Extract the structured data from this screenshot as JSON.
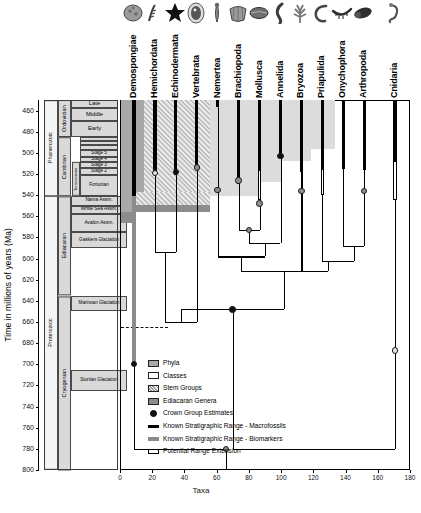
{
  "figure": {
    "y_axis_label": "Time in millions of years (Ma)",
    "x_axis_label": "Taxa",
    "y_ticks": [
      460,
      480,
      500,
      520,
      540,
      560,
      580,
      600,
      620,
      640,
      660,
      680,
      700,
      720,
      740,
      760,
      780,
      800
    ],
    "y_min": 450,
    "y_max": 800,
    "x_ticks": [
      0,
      20,
      40,
      60,
      80,
      100,
      120,
      140,
      160,
      180
    ],
    "x_min": 0,
    "x_max": 180
  },
  "colors": {
    "macrofossil": "#000000",
    "biomarker": "#8b8b8b",
    "extension": "#ffffff",
    "phyla_shade": "#a8a8a8",
    "classes_shade": "#ffffff",
    "stem_shade": "#9a9a9a",
    "ediacaran_shade": "#8c8c8c"
  },
  "timescale": {
    "eons": [
      {
        "label": "Phanerozoic",
        "top": 450,
        "bottom": 541
      },
      {
        "label": "Proterozoic",
        "top": 541,
        "bottom": 800
      }
    ],
    "periods": [
      {
        "label": "Ordovician",
        "top": 450,
        "bottom": 485
      },
      {
        "label": "Cambrian",
        "top": 485,
        "bottom": 541
      },
      {
        "label": "Ediacaran",
        "top": 541,
        "bottom": 635
      },
      {
        "label": "Cryogenian",
        "top": 635,
        "bottom": 800
      }
    ],
    "epochs": [
      {
        "label": "Late",
        "top": 450,
        "bottom": 458
      },
      {
        "label": "Middle",
        "top": 458,
        "bottom": 470
      },
      {
        "label": "Early",
        "top": 470,
        "bottom": 485
      }
    ],
    "cambrian_series": [
      {
        "label": "",
        "top": 485,
        "bottom": 489
      },
      {
        "label": "",
        "top": 489,
        "bottom": 493
      },
      {
        "label": "",
        "top": 493,
        "bottom": 497
      },
      {
        "label": "Stage 5",
        "top": 497,
        "bottom": 504
      },
      {
        "label": "Stage 4",
        "top": 504,
        "bottom": 509
      },
      {
        "label": "Stage 3",
        "top": 509,
        "bottom": 514
      },
      {
        "label": "Stage 2",
        "top": 514,
        "bottom": 521
      },
      {
        "label": "Fortunian",
        "top": 521,
        "bottom": 541
      }
    ],
    "cambrian_series_sidelabel": "Terreneuvian",
    "assemblages": [
      {
        "label": "Nama Assm.",
        "top": 541,
        "bottom": 550
      },
      {
        "label": "White Sea Assm.",
        "top": 550,
        "bottom": 558
      },
      {
        "label": "Avalon Assm.",
        "top": 558,
        "bottom": 575
      }
    ],
    "glaciations": [
      {
        "label": "Gaskiers Glaciation",
        "top": 575,
        "bottom": 590
      },
      {
        "label": "Marinoan Glaciation",
        "top": 635,
        "bottom": 650
      },
      {
        "label": "Sturtian Glaciation",
        "top": 705,
        "bottom": 725
      }
    ]
  },
  "legend": {
    "items": [
      {
        "key": "phyla-swatch",
        "label": "Phyla"
      },
      {
        "key": "classes-swatch",
        "label": "Classes"
      },
      {
        "key": "stem-groups-swatch",
        "label": "Stem Groups"
      },
      {
        "key": "ediacaran-genera-swatch",
        "label": "Ediacaran Genera"
      },
      {
        "key": "crown-group-node",
        "label": "Crown Group Estimates"
      },
      {
        "key": "macrofossil-bar",
        "label": "Known Stratigraphic Range - Macrofossils"
      },
      {
        "key": "biomarker-bar",
        "label": "Known Stratigraphic Range - Biomarkers"
      },
      {
        "key": "extension-bar",
        "label": "Potential Range Extension"
      }
    ]
  },
  "chart_data": {
    "type": "diagram",
    "title": "",
    "xlabel": "Taxa",
    "ylabel": "Time in millions of years (Ma)",
    "xlim": [
      0,
      180
    ],
    "ylim": [
      800,
      450
    ],
    "grid": false,
    "taxa": [
      {
        "name": "Demospongiae",
        "icon": "sponge-icon",
        "x": 8,
        "macro_top": 450,
        "macro_bottom": 541,
        "biomarker_top": 541,
        "biomarker_bottom": 700,
        "extension_top": null,
        "extension_bottom": null,
        "crown_ma": 700,
        "crown_style": "dark"
      },
      {
        "name": "Hemichordata",
        "icon": "graptolite-icon",
        "x": 21,
        "macro_top": 450,
        "macro_bottom": 521,
        "biomarker_top": null,
        "biomarker_bottom": null,
        "extension_top": null,
        "extension_bottom": null,
        "crown_ma": 519,
        "crown_style": "light"
      },
      {
        "name": "Echinodermata",
        "icon": "starfish-icon",
        "x": 34,
        "macro_top": 450,
        "macro_bottom": 521,
        "biomarker_top": null,
        "biomarker_bottom": null,
        "extension_top": null,
        "extension_bottom": null,
        "crown_ma": 518,
        "crown_style": "dark"
      },
      {
        "name": "Vertebrata",
        "icon": "fish-fossil-icon",
        "x": 47,
        "macro_top": 450,
        "macro_bottom": 516,
        "biomarker_top": null,
        "biomarker_bottom": null,
        "extension_top": null,
        "extension_bottom": null,
        "crown_ma": 514,
        "crown_style": "grey"
      },
      {
        "name": "Nemertea",
        "icon": "worm-icon",
        "x": 60,
        "macro_top": 450,
        "macro_bottom": 457,
        "biomarker_top": null,
        "biomarker_bottom": null,
        "extension_top": null,
        "extension_bottom": null,
        "crown_ma": 535,
        "crown_style": "grey"
      },
      {
        "name": "Brachiopoda",
        "icon": "brachiopod-icon",
        "x": 73,
        "macro_top": 450,
        "macro_bottom": 529,
        "biomarker_top": null,
        "biomarker_bottom": null,
        "extension_top": null,
        "extension_bottom": null,
        "crown_ma": 526,
        "crown_style": "grey"
      },
      {
        "name": "Mollusca",
        "icon": "mollusc-icon",
        "x": 86,
        "macro_top": 450,
        "macro_bottom": 516,
        "biomarker_top": null,
        "biomarker_bottom": null,
        "extension_top": 516,
        "extension_bottom": 545,
        "crown_ma": 548,
        "crown_style": "grey"
      },
      {
        "name": "Annelida",
        "icon": "annelid-icon",
        "x": 99,
        "macro_top": 450,
        "macro_bottom": 505,
        "biomarker_top": null,
        "biomarker_bottom": null,
        "extension_top": null,
        "extension_bottom": null,
        "crown_ma": 503,
        "crown_style": "dark"
      },
      {
        "name": "Bryozoa",
        "icon": "bryozoan-icon",
        "x": 112,
        "macro_top": 450,
        "macro_bottom": 518,
        "biomarker_top": null,
        "biomarker_bottom": null,
        "extension_top": null,
        "extension_bottom": null,
        "crown_ma": 536,
        "crown_style": "grey"
      },
      {
        "name": "Priapulida",
        "icon": "priapulid-icon",
        "x": 125,
        "macro_top": 450,
        "macro_bottom": 515,
        "biomarker_top": null,
        "biomarker_bottom": null,
        "extension_top": 515,
        "extension_bottom": 540,
        "crown_ma": null,
        "crown_style": null
      },
      {
        "name": "Onychophora",
        "icon": "onychophoran-icon",
        "x": 138,
        "macro_top": 450,
        "macro_bottom": 515,
        "biomarker_top": null,
        "biomarker_bottom": null,
        "extension_top": null,
        "extension_bottom": null,
        "crown_ma": null,
        "crown_style": null
      },
      {
        "name": "Arthropoda",
        "icon": "trilobite-icon",
        "x": 151,
        "macro_top": 450,
        "macro_bottom": 516,
        "biomarker_top": null,
        "biomarker_bottom": null,
        "extension_top": null,
        "extension_bottom": null,
        "crown_ma": 536,
        "crown_style": "grey"
      },
      {
        "name": "Cnidaria",
        "icon": "cnidarian-icon",
        "x": 170,
        "macro_top": 450,
        "macro_bottom": 508,
        "biomarker_top": null,
        "biomarker_bottom": null,
        "extension_top": 508,
        "extension_bottom": 545,
        "crown_ma": 687,
        "crown_style": "light"
      }
    ],
    "internal_nodes": [
      {
        "name": "hemichordata-echinodermata",
        "x": 27.5,
        "ma": 594
      },
      {
        "name": "ambulacraria-vertebrata",
        "x": 37.25,
        "ma": 660
      },
      {
        "name": "brachiopoda-mollusca",
        "x": 79.5,
        "ma": 573,
        "marker": "grey"
      },
      {
        "name": "lophotrochozoa-annelida",
        "x": 89.25,
        "ma": 585
      },
      {
        "name": "nemertea-lophotrochozoa",
        "x": 74.6,
        "ma": 598
      },
      {
        "name": "onychophora-arthropoda",
        "x": 144.5,
        "ma": 588
      },
      {
        "name": "bryozoa-panarthropoda",
        "x": 128.2,
        "ma": 602
      },
      {
        "name": "spiralia-ecdysozoa",
        "x": 101.4,
        "ma": 612
      },
      {
        "name": "protostomia-deuterostomia",
        "x": 69.3,
        "ma": 648,
        "marker": "dark"
      },
      {
        "name": "bilateria-cnidaria-root",
        "x": 65,
        "ma": 780,
        "marker": "grey"
      },
      {
        "name": "demospongiae-split",
        "x": 36.5,
        "ma": 780
      }
    ],
    "reference_line_ma": 665
  },
  "taxa_labels": [
    "Demospongiae",
    "Hemichordata",
    "Echinodermata",
    "Vertebrata",
    "Nemertea",
    "Brachiopoda",
    "Mollusca",
    "Annelida",
    "Bryozoa",
    "Priapulida",
    "Onychophora",
    "Arthropoda",
    "Cnidaria"
  ]
}
